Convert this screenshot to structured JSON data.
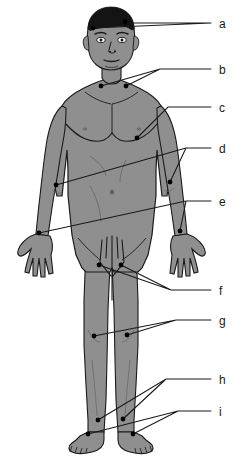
{
  "figure": {
    "type": "anatomical-diagram",
    "background_color": "#ffffff",
    "body_fill_color": "#8f8f8f",
    "body_shadow_color": "#7c7c7c",
    "outline_color": "#1a1a1a",
    "hair_color": "#141414",
    "marker_color": "#000000",
    "leader_line_color": "#1a1a1a",
    "label_text_color": "#1a1a1a"
  },
  "labels": [
    {
      "id": "a",
      "text": "a",
      "x": 219,
      "y": 18,
      "anchor_x": 211,
      "anchor_y": 23,
      "target": "head-temple-markers",
      "points": [
        {
          "x": 93,
          "y": 28
        },
        {
          "x": 125,
          "y": 22
        }
      ]
    },
    {
      "id": "b",
      "text": "b",
      "x": 219,
      "y": 64,
      "anchor_x": 211,
      "anchor_y": 69,
      "target": "supraclavicular-neck-markers",
      "points": [
        {
          "x": 101,
          "y": 86
        },
        {
          "x": 126,
          "y": 86
        }
      ]
    },
    {
      "id": "c",
      "text": "c",
      "x": 219,
      "y": 102,
      "anchor_x": 211,
      "anchor_y": 107,
      "target": "axillary-chest-marker",
      "points": [
        {
          "x": 137,
          "y": 138
        }
      ]
    },
    {
      "id": "d",
      "text": "d",
      "x": 219,
      "y": 143,
      "anchor_x": 211,
      "anchor_y": 148,
      "target": "elbow-epitrochlear-markers",
      "points": [
        {
          "x": 56,
          "y": 185
        },
        {
          "x": 170,
          "y": 182
        }
      ]
    },
    {
      "id": "e",
      "text": "e",
      "x": 219,
      "y": 196,
      "anchor_x": 211,
      "anchor_y": 201,
      "target": "wrist-markers",
      "points": [
        {
          "x": 39,
          "y": 233
        },
        {
          "x": 180,
          "y": 231
        }
      ]
    },
    {
      "id": "f",
      "text": "f",
      "x": 219,
      "y": 285,
      "anchor_x": 211,
      "anchor_y": 290,
      "target": "inguinal-groin-markers",
      "points": [
        {
          "x": 99,
          "y": 265
        },
        {
          "x": 121,
          "y": 265
        }
      ]
    },
    {
      "id": "g",
      "text": "g",
      "x": 219,
      "y": 315,
      "anchor_x": 211,
      "anchor_y": 320,
      "target": "knee-popliteal-markers",
      "points": [
        {
          "x": 94,
          "y": 336
        },
        {
          "x": 127,
          "y": 335
        }
      ]
    },
    {
      "id": "h",
      "text": "h",
      "x": 219,
      "y": 374,
      "anchor_x": 211,
      "anchor_y": 379,
      "target": "lower-leg-markers",
      "points": [
        {
          "x": 98,
          "y": 420
        },
        {
          "x": 123,
          "y": 419
        }
      ]
    },
    {
      "id": "i",
      "text": "i",
      "x": 219,
      "y": 406,
      "anchor_x": 211,
      "anchor_y": 411,
      "target": "ankle-foot-markers",
      "points": [
        {
          "x": 88,
          "y": 434
        },
        {
          "x": 133,
          "y": 434
        }
      ]
    }
  ],
  "markers": [
    {
      "label": "a",
      "x": 93,
      "y": 28
    },
    {
      "label": "a",
      "x": 125,
      "y": 22
    },
    {
      "label": "b",
      "x": 101,
      "y": 86
    },
    {
      "label": "b",
      "x": 126,
      "y": 86
    },
    {
      "label": "c",
      "x": 137,
      "y": 138
    },
    {
      "label": "d",
      "x": 56,
      "y": 185
    },
    {
      "label": "d",
      "x": 170,
      "y": 182
    },
    {
      "label": "e",
      "x": 39,
      "y": 233
    },
    {
      "label": "e",
      "x": 180,
      "y": 231
    },
    {
      "label": "f",
      "x": 99,
      "y": 265
    },
    {
      "label": "f",
      "x": 121,
      "y": 265
    },
    {
      "label": "g",
      "x": 94,
      "y": 336
    },
    {
      "label": "g",
      "x": 127,
      "y": 335
    },
    {
      "label": "h",
      "x": 98,
      "y": 420
    },
    {
      "label": "h",
      "x": 123,
      "y": 419
    },
    {
      "label": "i",
      "x": 88,
      "y": 434
    },
    {
      "label": "i",
      "x": 133,
      "y": 434
    }
  ]
}
